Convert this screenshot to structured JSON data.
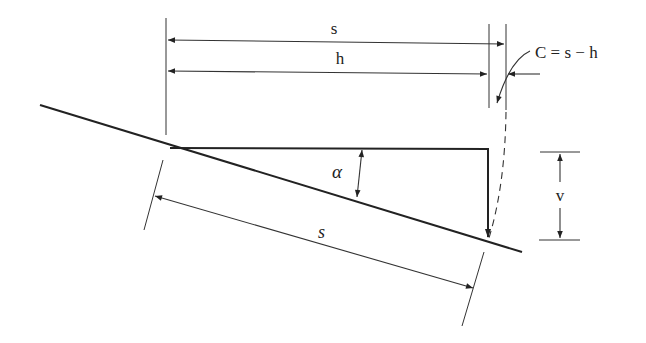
{
  "diagram": {
    "labels": {
      "s_top": "s",
      "h": "h",
      "correction": "C = s − h",
      "alpha": "α",
      "v": "v",
      "s_slope": "s"
    },
    "colors": {
      "line": "#222222",
      "background": "#ffffff"
    }
  }
}
